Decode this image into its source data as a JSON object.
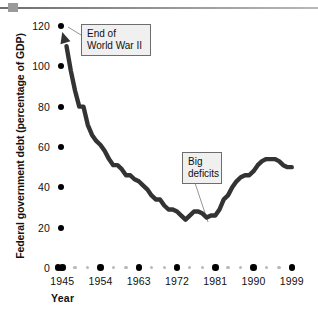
{
  "chart_data": {
    "type": "line",
    "title": "",
    "xlabel": "Year",
    "ylabel": "Federal government debt (percentage of GDP)",
    "xlim": [
      1944,
      2000
    ],
    "ylim": [
      0,
      120
    ],
    "yticks": [
      0,
      20,
      40,
      60,
      80,
      100,
      120
    ],
    "xticks": [
      1945,
      1954,
      1963,
      1972,
      1981,
      1990,
      1999
    ],
    "xtick_labels": [
      "1945",
      "1954",
      "1963",
      "1972",
      "1981",
      "1990",
      "1999"
    ],
    "ytick_labels": [
      "0",
      "20",
      "40",
      "60",
      "80",
      "100",
      "120"
    ],
    "grid": false,
    "legend": null,
    "series_name": "Federal government debt",
    "line_color": "#333333",
    "x": [
      1945,
      1946,
      1947,
      1948,
      1949,
      1950,
      1951,
      1952,
      1953,
      1954,
      1955,
      1956,
      1957,
      1958,
      1959,
      1960,
      1961,
      1962,
      1963,
      1964,
      1965,
      1966,
      1967,
      1968,
      1969,
      1970,
      1971,
      1972,
      1973,
      1974,
      1975,
      1976,
      1977,
      1978,
      1979,
      1980,
      1981,
      1982,
      1983,
      1984,
      1985,
      1986,
      1987,
      1988,
      1989,
      1990,
      1991,
      1992,
      1993,
      1994,
      1995,
      1996,
      1997,
      1998,
      1999
    ],
    "y": [
      114,
      110,
      98,
      88,
      80,
      80,
      71,
      66,
      63,
      61,
      58,
      54,
      51,
      51,
      49,
      46,
      46,
      44,
      43,
      41,
      39,
      36,
      34,
      34,
      31,
      29,
      29,
      28,
      26,
      24,
      26,
      28,
      28,
      27,
      25,
      26,
      26,
      29,
      34,
      36,
      40,
      43,
      45,
      46,
      46,
      48,
      51,
      53,
      54,
      54,
      54,
      53,
      51,
      50,
      50
    ],
    "annotations": [
      {
        "id": "ww2",
        "text": "End of\nWorld War II",
        "points_to_year": 1946,
        "points_to_value": 113
      },
      {
        "id": "deficits",
        "text": "Big\ndeficits",
        "points_to_year": 1982,
        "points_to_value": 28
      }
    ]
  },
  "axis": {
    "y_title": "Federal government debt (percentage of GDP)",
    "x_title": "Year",
    "y_ticks": [
      {
        "label": "120"
      },
      {
        "label": "100"
      },
      {
        "label": "80"
      },
      {
        "label": "60"
      },
      {
        "label": "40"
      },
      {
        "label": "20"
      },
      {
        "label": "0"
      }
    ],
    "x_ticks": [
      {
        "label": "1945"
      },
      {
        "label": "1954"
      },
      {
        "label": "1963"
      },
      {
        "label": "1972"
      },
      {
        "label": "1981"
      },
      {
        "label": "1990"
      },
      {
        "label": "1999"
      }
    ]
  },
  "annotations": {
    "ww2": "End of\nWorld War II",
    "deficits": "Big\ndeficits"
  }
}
